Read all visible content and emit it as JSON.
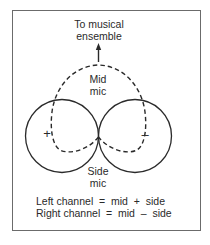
{
  "diagram": {
    "title_label": {
      "line1": "To musical",
      "line2": "ensemble"
    },
    "mid_mic": {
      "line1": "Mid",
      "line2": "mic",
      "pattern": "cardioid",
      "stroke": "dashed"
    },
    "side_mic": {
      "line1": "Side",
      "line2": "mic",
      "pattern": "figure-eight",
      "stroke": "solid",
      "left_lobe_sign": "+",
      "right_lobe_sign": "–"
    },
    "equations": {
      "left": "Left channel  =  mid  +  side",
      "right": "Right channel  =  mid  –  side"
    },
    "colors": {
      "line": "#2a2a2a",
      "frame": "#6b6b6b",
      "background": "#ffffff"
    }
  }
}
